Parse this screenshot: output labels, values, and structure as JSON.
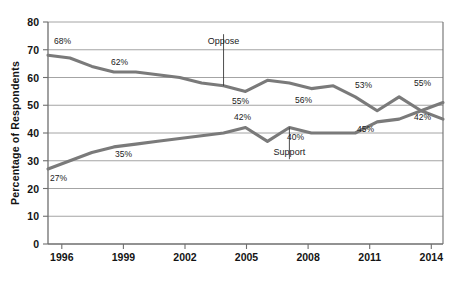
{
  "chart_data": {
    "type": "line",
    "title": "",
    "subtitle": "",
    "xlabel": "",
    "ylabel": "Percentage of Respondents",
    "xlim": [
      1996,
      2014
    ],
    "ylim": [
      0,
      80
    ],
    "ytick_step": 10,
    "grid": true,
    "legend_position": "inline-annotation",
    "x_ticks": [
      "1996",
      "1999",
      "2002",
      "2005",
      "2008",
      "2011",
      "2014"
    ],
    "y_ticks": [
      "0",
      "10",
      "20",
      "30",
      "40",
      "50",
      "60",
      "70",
      "80"
    ],
    "x": [
      1996,
      1997,
      1998,
      1999,
      2000,
      2001,
      2002,
      2003,
      2004,
      2005,
      2006,
      2007,
      2008,
      2009,
      2010,
      2011,
      2012,
      2013,
      2014
    ],
    "series": [
      {
        "name": "Oppose",
        "color": "#7a7a7a",
        "values": [
          68,
          67,
          64,
          62,
          62,
          61,
          60,
          58,
          57,
          55,
          59,
          58,
          56,
          57,
          53,
          48,
          53,
          48,
          45
        ]
      },
      {
        "name": "Support",
        "color": "#7a7a7a",
        "values": [
          27,
          30,
          33,
          35,
          36,
          37,
          38,
          39,
          40,
          42,
          37,
          42,
          40,
          40,
          40,
          44,
          45,
          48,
          51
        ]
      }
    ],
    "series_labels": [
      {
        "text": "Oppose",
        "x": 2004,
        "y": 72,
        "leader_to_y": 57
      },
      {
        "text": "Support",
        "x": 2007,
        "y": 32,
        "leader_to_y": 42
      }
    ],
    "data_labels": [
      {
        "text": "68%",
        "series": "Oppose",
        "x": 1996,
        "y": 68
      },
      {
        "text": "62%",
        "series": "Oppose",
        "x": 1999,
        "y": 62
      },
      {
        "text": "55%",
        "series": "Oppose",
        "x": 2005,
        "y": 55
      },
      {
        "text": "56%",
        "series": "Oppose",
        "x": 2008,
        "y": 56
      },
      {
        "text": "53%",
        "series": "Oppose",
        "x": 2011,
        "y": 53
      },
      {
        "text": "55%",
        "series": "Support",
        "x": 2014,
        "y": 55
      },
      {
        "text": "27%",
        "series": "Support",
        "x": 1996,
        "y": 27
      },
      {
        "text": "35%",
        "series": "Support",
        "x": 1999,
        "y": 35
      },
      {
        "text": "42%",
        "series": "Support",
        "x": 2005,
        "y": 42
      },
      {
        "text": "40%",
        "series": "Support",
        "x": 2007,
        "y": 40
      },
      {
        "text": "45%",
        "series": "Support",
        "x": 2011,
        "y": 45
      },
      {
        "text": "42%",
        "series": "Oppose",
        "x": 2014,
        "y": 42
      }
    ]
  },
  "labels": {
    "ylabel": "Percentage of Respondents",
    "oppose": "Oppose",
    "support": "Support",
    "d_68": "68%",
    "d_62": "62%",
    "d_55a": "55%",
    "d_56": "56%",
    "d_53": "53%",
    "d_55b": "55%",
    "d_27": "27%",
    "d_35": "35%",
    "d_42a": "42%",
    "d_40": "40%",
    "d_45": "45%",
    "d_42b": "42%",
    "t_1996": "1996",
    "t_1999": "1999",
    "t_2002": "2002",
    "t_2005": "2005",
    "t_2008": "2008",
    "t_2011": "2011",
    "t_2014": "2014",
    "y_0": "0",
    "y_10": "10",
    "y_20": "20",
    "y_30": "30",
    "y_40": "40",
    "y_50": "50",
    "y_60": "60",
    "y_70": "70",
    "y_80": "80"
  },
  "colors": {
    "line": "#7a7a7a",
    "grid": "#9a9a9a",
    "axis": "#6e6e6e",
    "text": "#141414"
  }
}
